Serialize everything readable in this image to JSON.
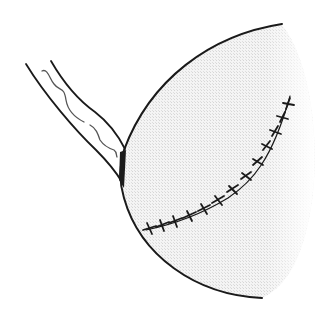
{
  "figure": {
    "description": "Line drawing of a sutured organ with attached vascular pedicle",
    "colors": {
      "background": "#ffffff",
      "ink": "#1a1a1a",
      "organ_fill": "#ececec",
      "vessel_line": "#555555"
    },
    "elements": [
      {
        "name": "pedicle",
        "label": "Pedicle / stalk"
      },
      {
        "name": "organ",
        "label": "Organ surface"
      },
      {
        "name": "suture-line",
        "label": "Sutured incision",
        "stitch_count": 13
      }
    ]
  }
}
